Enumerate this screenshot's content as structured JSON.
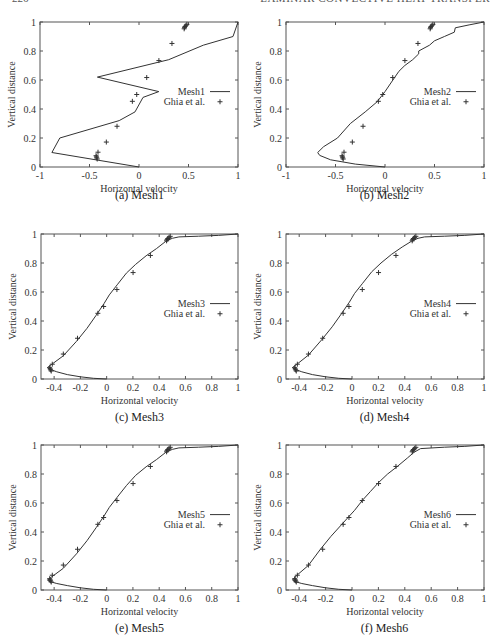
{
  "running_head": {
    "page_number": "226",
    "title": "LAMINAR CONVECTIVE HEAT TRANSFER"
  },
  "chart_data": [
    {
      "id": "a",
      "type": "line",
      "caption": "(a) Mesh1",
      "xlabel": "Horizontal velocity",
      "ylabel": "Vertical distance",
      "xlim": [
        -1,
        1
      ],
      "ylim": [
        0,
        1
      ],
      "xticks": [
        -1,
        -0.5,
        0,
        0.5,
        1
      ],
      "xtick_labels": [
        "-1",
        "-0.5",
        "0",
        "0.5",
        "1"
      ],
      "yticks": [
        0,
        0.2,
        0.4,
        0.6,
        0.8,
        1
      ],
      "ytick_labels": [
        "0",
        "0.2",
        "0.4",
        "0.6",
        "0.8",
        "1"
      ],
      "legend": {
        "line": "Mesh1",
        "points": "Ghia et al."
      },
      "series": [
        {
          "name": "Mesh1",
          "style": "line",
          "x": [
            0,
            -0.88,
            -0.8,
            -0.2,
            -0.04,
            0.04,
            0.2,
            -0.42,
            0.3,
            0.65,
            0.95,
            1
          ],
          "y": [
            0,
            0.1,
            0.2,
            0.32,
            0.38,
            0.48,
            0.52,
            0.62,
            0.74,
            0.84,
            0.9,
            1
          ]
        }
      ]
    },
    {
      "id": "b",
      "type": "line",
      "caption": "(b) Mesh2",
      "xlabel": "Horizontal velocity",
      "ylabel": "Vertical distance",
      "xlim": [
        -1,
        1
      ],
      "ylim": [
        0,
        1
      ],
      "xticks": [
        -1,
        -0.5,
        0,
        0.5,
        1
      ],
      "xtick_labels": [
        "-1",
        "-0.5",
        "0",
        "0.5",
        "1"
      ],
      "yticks": [
        0,
        0.2,
        0.4,
        0.6,
        0.8,
        1
      ],
      "ytick_labels": [
        "0",
        "0.2",
        "0.4",
        "0.6",
        "0.8",
        "1"
      ],
      "legend": {
        "line": "Mesh2",
        "points": "Ghia et al."
      },
      "series": [
        {
          "name": "Mesh2",
          "style": "line",
          "x": [
            0,
            -0.3,
            -0.55,
            -0.66,
            -0.68,
            -0.62,
            -0.48,
            -0.35,
            -0.2,
            -0.08,
            0.0,
            0.08,
            0.14,
            0.2,
            0.28,
            0.34,
            0.34,
            0.45,
            0.5,
            0.6,
            0.7,
            0.71,
            0.85,
            1
          ],
          "y": [
            0,
            0.02,
            0.05,
            0.08,
            0.1,
            0.14,
            0.2,
            0.3,
            0.38,
            0.45,
            0.52,
            0.6,
            0.66,
            0.7,
            0.74,
            0.78,
            0.8,
            0.84,
            0.87,
            0.9,
            0.93,
            0.96,
            0.98,
            1
          ]
        }
      ]
    },
    {
      "id": "c",
      "type": "line",
      "caption": "(c) Mesh3",
      "xlabel": "Horizontal velocity",
      "ylabel": "Vertical distance",
      "xlim": [
        -0.5,
        1
      ],
      "ylim": [
        0,
        1
      ],
      "xticks": [
        -0.4,
        -0.2,
        0,
        0.2,
        0.4,
        0.6,
        0.8,
        1
      ],
      "xtick_labels": [
        "-0.4",
        "-0.2",
        "0",
        "0.2",
        "0.4",
        "0.6",
        "0.8",
        "1"
      ],
      "yticks": [
        0,
        0.2,
        0.4,
        0.6,
        0.8,
        1
      ],
      "ytick_labels": [
        "0",
        "0.2",
        "0.4",
        "0.6",
        "0.8",
        "1"
      ],
      "legend": {
        "line": "Mesh3",
        "points": "Ghia et al."
      },
      "series": [
        {
          "name": "Mesh3",
          "style": "line",
          "x": [
            0,
            -0.1,
            -0.2,
            -0.3,
            -0.38,
            -0.44,
            -0.45,
            -0.42,
            -0.33,
            -0.23,
            -0.15,
            -0.08,
            -0.02,
            0.02,
            0.08,
            0.15,
            0.22,
            0.3,
            0.38,
            0.45,
            0.5,
            0.55,
            0.7,
            0.85,
            1
          ],
          "y": [
            0,
            0.005,
            0.015,
            0.03,
            0.05,
            0.07,
            0.08,
            0.1,
            0.16,
            0.26,
            0.35,
            0.44,
            0.52,
            0.58,
            0.65,
            0.73,
            0.79,
            0.85,
            0.9,
            0.95,
            0.97,
            0.98,
            0.985,
            0.99,
            1
          ]
        }
      ]
    },
    {
      "id": "d",
      "type": "line",
      "caption": "(d) Mesh4",
      "xlabel": "Horizontal velocity",
      "ylabel": "Vertical distance",
      "xlim": [
        -0.5,
        1
      ],
      "ylim": [
        0,
        1
      ],
      "xticks": [
        -0.4,
        -0.2,
        0,
        0.2,
        0.4,
        0.6,
        0.8,
        1
      ],
      "xtick_labels": [
        "-0.4",
        "-0.2",
        "0",
        "0.2",
        "0.4",
        "0.6",
        "0.8",
        "1"
      ],
      "yticks": [
        0,
        0.2,
        0.4,
        0.6,
        0.8,
        1
      ],
      "ytick_labels": [
        "0",
        "0.2",
        "0.4",
        "0.6",
        "0.8",
        "1"
      ],
      "legend": {
        "line": "Mesh4",
        "points": "Ghia et al."
      },
      "series": [
        {
          "name": "Mesh4",
          "style": "line",
          "x": [
            0,
            -0.1,
            -0.2,
            -0.3,
            -0.38,
            -0.44,
            -0.45,
            -0.42,
            -0.33,
            -0.23,
            -0.15,
            -0.08,
            -0.02,
            0.02,
            0.08,
            0.15,
            0.22,
            0.3,
            0.38,
            0.45,
            0.5,
            0.55,
            0.7,
            0.85,
            1
          ],
          "y": [
            0,
            0.005,
            0.015,
            0.03,
            0.05,
            0.07,
            0.08,
            0.1,
            0.165,
            0.27,
            0.36,
            0.45,
            0.53,
            0.59,
            0.66,
            0.74,
            0.8,
            0.86,
            0.91,
            0.95,
            0.97,
            0.98,
            0.985,
            0.99,
            1
          ]
        }
      ]
    },
    {
      "id": "e",
      "type": "line",
      "caption": "(e) Mesh5",
      "xlabel": "Horizontal velocity",
      "ylabel": "Vertical distance",
      "xlim": [
        -0.5,
        1
      ],
      "ylim": [
        0,
        1
      ],
      "xticks": [
        -0.4,
        -0.2,
        0,
        0.2,
        0.4,
        0.6,
        0.8,
        1
      ],
      "xtick_labels": [
        "-0.4",
        "-0.2",
        "0",
        "0.2",
        "0.4",
        "0.6",
        "0.8",
        "1"
      ],
      "yticks": [
        0,
        0.2,
        0.4,
        0.6,
        0.8,
        1
      ],
      "ytick_labels": [
        "0",
        "0.2",
        "0.4",
        "0.6",
        "0.8",
        "1"
      ],
      "legend": {
        "line": "Mesh5",
        "points": "Ghia et al."
      },
      "series": [
        {
          "name": "Mesh5",
          "style": "line",
          "x": [
            0,
            -0.1,
            -0.2,
            -0.3,
            -0.38,
            -0.44,
            -0.45,
            -0.42,
            -0.33,
            -0.23,
            -0.15,
            -0.08,
            -0.02,
            0.02,
            0.08,
            0.15,
            0.22,
            0.3,
            0.38,
            0.45,
            0.5,
            0.55,
            0.7,
            0.85,
            1
          ],
          "y": [
            0,
            0.005,
            0.015,
            0.03,
            0.045,
            0.06,
            0.07,
            0.09,
            0.15,
            0.25,
            0.34,
            0.43,
            0.51,
            0.57,
            0.64,
            0.72,
            0.79,
            0.85,
            0.9,
            0.95,
            0.97,
            0.98,
            0.985,
            0.99,
            1
          ]
        }
      ]
    },
    {
      "id": "f",
      "type": "line",
      "caption": "(f) Mesh6",
      "xlabel": "Horizontal velocity",
      "ylabel": "Vertical distance",
      "xlim": [
        -0.5,
        1
      ],
      "ylim": [
        0,
        1
      ],
      "xticks": [
        -0.4,
        -0.2,
        0,
        0.2,
        0.4,
        0.6,
        0.8,
        1
      ],
      "xtick_labels": [
        "-0.4",
        "-0.2",
        "0",
        "0.2",
        "0.4",
        "0.6",
        "0.8",
        "1"
      ],
      "yticks": [
        0,
        0.2,
        0.4,
        0.6,
        0.8,
        1
      ],
      "ytick_labels": [
        "0",
        "0.2",
        "0.4",
        "0.6",
        "0.8",
        "1"
      ],
      "legend": {
        "line": "Mesh6",
        "points": "Ghia et al."
      },
      "series": [
        {
          "name": "Mesh6",
          "style": "line",
          "x": [
            0,
            -0.1,
            -0.2,
            -0.3,
            -0.38,
            -0.44,
            -0.45,
            -0.42,
            -0.33,
            -0.24,
            -0.16,
            -0.08,
            -0.03,
            0.02,
            0.08,
            0.14,
            0.2,
            0.27,
            0.34,
            0.42,
            0.47,
            0.52,
            0.7,
            0.85,
            1
          ],
          "y": [
            0,
            0.005,
            0.015,
            0.03,
            0.045,
            0.06,
            0.07,
            0.1,
            0.17,
            0.28,
            0.37,
            0.45,
            0.5,
            0.55,
            0.62,
            0.68,
            0.74,
            0.8,
            0.85,
            0.91,
            0.95,
            0.975,
            0.985,
            0.99,
            1
          ]
        }
      ]
    }
  ],
  "ghia_points": {
    "name": "Ghia et al.",
    "x": [
      -0.422,
      -0.427,
      -0.43,
      -0.434,
      -0.414,
      -0.33,
      -0.222,
      -0.067,
      -0.023,
      0.078,
      0.201,
      0.333,
      0.456,
      0.46,
      0.465,
      0.475,
      0.484
    ],
    "y": [
      0.055,
      0.063,
      0.07,
      0.078,
      0.102,
      0.172,
      0.281,
      0.453,
      0.5,
      0.617,
      0.734,
      0.852,
      0.953,
      0.961,
      0.969,
      0.977,
      0.984
    ]
  }
}
